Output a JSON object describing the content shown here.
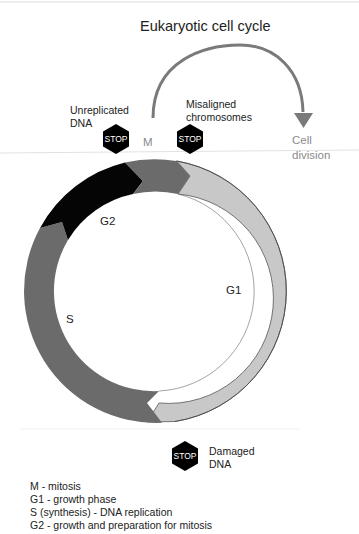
{
  "title": "Eukaryotic cell cycle",
  "checkpoints": [
    {
      "id": "unreplicated-dna",
      "label_lines": [
        "Unreplicated",
        "DNA"
      ],
      "sign": "STOP"
    },
    {
      "id": "misaligned-chromosomes",
      "label_lines": [
        "Misaligned",
        "chromosomes"
      ],
      "sign": "STOP"
    },
    {
      "id": "damaged-dna",
      "label_lines": [
        "Damaged",
        "DNA"
      ],
      "sign": "STOP"
    }
  ],
  "cell_division": {
    "label_lines": [
      "Cell",
      "division"
    ]
  },
  "phases": {
    "M": {
      "label": "M",
      "color": "#6b6b6b"
    },
    "G1": {
      "label": "G1",
      "color": "#c8c8c8"
    },
    "S": {
      "label": "S",
      "color": "#6b6b6b"
    },
    "G2": {
      "label": "G2",
      "color": "#0a0a0a"
    }
  },
  "legend": [
    "M - mitosis",
    "G1 - growth phase",
    "S (synthesis) - DNA replication",
    "G2 - growth and preparation for mitosis"
  ],
  "colors": {
    "arrow": "#7a7a7a",
    "stop_sign": "#000000",
    "ring_outline": "#555555"
  }
}
